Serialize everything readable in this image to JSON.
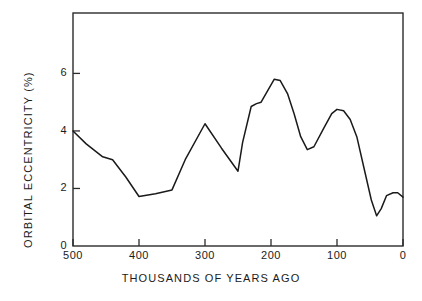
{
  "chart_data": {
    "type": "line",
    "title": "",
    "subtitle": "",
    "xlabel": "THOUSANDS OF YEARS AGO",
    "ylabel": "ORBITAL ECCENTRICITY (%)",
    "xlim": [
      500,
      0
    ],
    "ylim": [
      0,
      8.1
    ],
    "x_reversed": true,
    "grid": false,
    "legend": null,
    "annotations": [],
    "xticks": [
      500,
      400,
      300,
      200,
      100,
      0
    ],
    "xtick_labels": [
      "500",
      "400",
      "300",
      "200",
      "100",
      "0"
    ],
    "yticks": [
      0,
      2,
      4,
      6
    ],
    "ytick_labels": [
      "0",
      "2",
      "4",
      "6"
    ],
    "line_color": "#1a1a1a",
    "series": [
      {
        "name": "Orbital eccentricity",
        "x": [
          500,
          480,
          455,
          440,
          420,
          400,
          375,
          350,
          330,
          300,
          275,
          250,
          243,
          230,
          222,
          215,
          205,
          195,
          186,
          175,
          165,
          155,
          145,
          135,
          120,
          108,
          100,
          90,
          80,
          70,
          58,
          48,
          40,
          33,
          25,
          15,
          8,
          0
        ],
        "values": [
          4.0,
          3.55,
          3.1,
          3.0,
          2.4,
          1.72,
          1.82,
          1.95,
          3.0,
          4.25,
          3.4,
          2.6,
          3.6,
          4.85,
          4.95,
          5.0,
          5.4,
          5.8,
          5.75,
          5.3,
          4.6,
          3.8,
          3.35,
          3.45,
          4.1,
          4.6,
          4.75,
          4.7,
          4.4,
          3.8,
          2.6,
          1.6,
          1.05,
          1.3,
          1.75,
          1.85,
          1.85,
          1.7
        ]
      }
    ]
  },
  "axes": {
    "x_title": "THOUSANDS OF YEARS AGO",
    "y_title": "ORBITAL ECCENTRICITY (%)"
  }
}
